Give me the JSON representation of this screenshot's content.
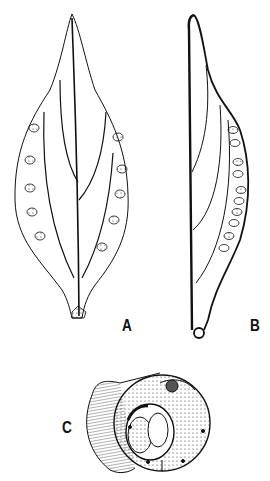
{
  "figure": {
    "panels": [
      {
        "id": "A",
        "label": "A",
        "description": "Leaf, adaxial view with marginal sori"
      },
      {
        "id": "B",
        "label": "B",
        "description": "Leaf, lateral view with sori along one side"
      },
      {
        "id": "C",
        "label": "C",
        "description": "Cross-section of stem/rachis"
      }
    ]
  },
  "colors": {
    "ink": "#111111",
    "background": "#ffffff"
  }
}
